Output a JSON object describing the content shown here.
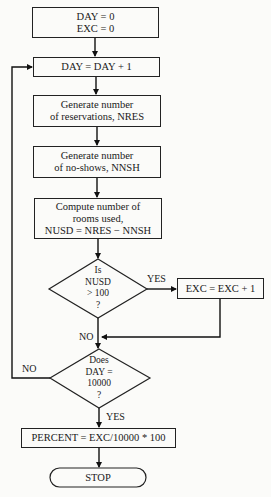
{
  "diagram": {
    "type": "flowchart",
    "nodes": {
      "init": {
        "lines": [
          "DAY = 0",
          "EXC = 0"
        ]
      },
      "increment_day": {
        "lines": [
          "DAY = DAY + 1"
        ]
      },
      "gen_reservations": {
        "lines": [
          "Generate number",
          "of reservations, NRES"
        ]
      },
      "gen_noshows": {
        "lines": [
          "Generate number",
          "of no-shows, NNSH"
        ]
      },
      "compute_rooms": {
        "lines": [
          "Compute number of",
          "rooms used,",
          "NUSD = NRES − NNSH"
        ]
      },
      "decision_nusd": {
        "lines": [
          "Is",
          "NUSD",
          "> 100",
          "?"
        ]
      },
      "increment_exc": {
        "lines": [
          "EXC = EXC + 1"
        ]
      },
      "decision_day": {
        "lines": [
          "Does",
          "DAY =",
          "10000",
          "?"
        ]
      },
      "percent": {
        "lines": [
          "PERCENT =  EXC/10000 * 100"
        ]
      },
      "stop": {
        "lines": [
          "STOP"
        ]
      }
    },
    "edge_labels": {
      "nusd_yes": "YES",
      "nusd_no": "NO",
      "day_no": "NO",
      "day_yes": "YES"
    }
  }
}
